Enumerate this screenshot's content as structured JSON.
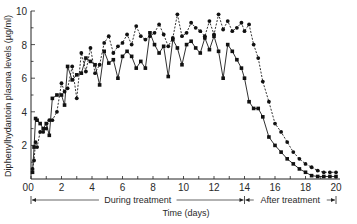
{
  "chart_data": {
    "type": "line",
    "title": "",
    "xlabel": "Time (days)",
    "ylabel": "Diphenylhydantoin plasma levels (µg/ml)",
    "xlim": [
      0,
      20
    ],
    "ylim": [
      0,
      10
    ],
    "x_ticks": [
      "0",
      "2",
      "4",
      "6",
      "8",
      "10",
      "12",
      "14",
      "16",
      "18",
      "20"
    ],
    "y_ticks": [
      "2",
      "4",
      "6",
      "8",
      "10"
    ],
    "y_origin_label": "0",
    "grid": false,
    "legend": null,
    "annotations": [
      {
        "text": "During treatment",
        "from": 0,
        "to": 14
      },
      {
        "text": "After treatment",
        "from": 14,
        "to": 20
      }
    ],
    "series": [
      {
        "name": "solid (squares)",
        "style": "solid",
        "x": [
          0.1,
          0.2,
          0.3,
          0.4,
          0.6,
          0.8,
          1.0,
          1.2,
          1.4,
          1.7,
          2.0,
          2.2,
          2.4,
          2.7,
          3.0,
          3.3,
          3.6,
          3.9,
          4.2,
          4.5,
          4.8,
          5.1,
          5.4,
          5.7,
          6.0,
          6.3,
          6.6,
          6.9,
          7.2,
          7.5,
          7.8,
          8.1,
          8.4,
          8.7,
          9.0,
          9.3,
          9.6,
          9.9,
          10.2,
          10.5,
          10.8,
          11.1,
          11.4,
          11.7,
          12.0,
          12.3,
          12.6,
          12.9,
          13.2,
          13.5,
          13.8,
          14.0,
          14.3,
          14.6,
          14.9,
          15.2,
          15.6,
          16.0,
          16.4,
          16.8,
          17.2,
          17.6,
          18.0,
          18.4,
          18.8,
          19.2,
          19.6,
          20.0
        ],
        "values": [
          0.4,
          1.9,
          3.6,
          3.5,
          3.3,
          3.0,
          3.3,
          2.6,
          4.8,
          5.0,
          5.0,
          4.4,
          6.7,
          5.9,
          6.2,
          6.3,
          7.2,
          7.0,
          6.8,
          5.6,
          7.6,
          6.9,
          7.1,
          6.0,
          7.3,
          7.6,
          7.3,
          6.6,
          7.0,
          6.6,
          8.7,
          8.0,
          7.5,
          7.9,
          6.1,
          8.3,
          7.8,
          6.8,
          8.0,
          8.2,
          7.8,
          7.5,
          8.4,
          7.7,
          8.5,
          7.6,
          6.0,
          8.0,
          7.6,
          7.1,
          6.6,
          6.0,
          4.6,
          4.2,
          4.2,
          3.7,
          2.5,
          2.0,
          1.6,
          1.2,
          0.9,
          0.6,
          0.4,
          0.2,
          0.15,
          0.15,
          0.15,
          0.15
        ]
      },
      {
        "name": "dashed (circles)",
        "style": "dashed",
        "x": [
          0.1,
          0.2,
          0.3,
          0.4,
          0.6,
          0.8,
          1.0,
          1.2,
          1.4,
          1.7,
          2.0,
          2.2,
          2.4,
          2.7,
          3.0,
          3.3,
          3.6,
          3.9,
          4.2,
          4.5,
          4.8,
          5.1,
          5.4,
          5.7,
          6.0,
          6.3,
          6.6,
          6.9,
          7.2,
          7.5,
          7.8,
          8.1,
          8.4,
          8.7,
          9.0,
          9.3,
          9.6,
          9.9,
          10.2,
          10.5,
          10.8,
          11.1,
          11.4,
          11.7,
          12.0,
          12.3,
          12.6,
          12.9,
          13.2,
          13.5,
          13.8,
          14.0,
          14.3,
          14.6,
          14.9,
          15.2,
          15.6,
          16.0,
          16.4,
          16.8,
          17.2,
          17.6,
          18.0,
          18.4,
          18.8,
          19.2,
          19.6,
          20.0
        ],
        "values": [
          0.6,
          1.1,
          2.2,
          1.9,
          2.8,
          2.8,
          3.0,
          3.5,
          3.5,
          4.0,
          5.7,
          5.2,
          5.4,
          6.7,
          4.8,
          7.5,
          6.4,
          7.8,
          6.3,
          6.8,
          8.1,
          8.5,
          7.5,
          7.9,
          8.1,
          8.6,
          8.0,
          9.1,
          8.5,
          8.3,
          8.5,
          8.7,
          9.2,
          8.6,
          7.9,
          8.4,
          9.8,
          8.5,
          8.7,
          9.3,
          9.0,
          8.8,
          8.5,
          9.4,
          8.6,
          9.8,
          8.9,
          9.4,
          8.8,
          9.0,
          9.3,
          8.8,
          9.2,
          8.0,
          7.2,
          5.8,
          4.6,
          3.3,
          2.8,
          2.2,
          1.6,
          1.2,
          0.9,
          0.7,
          0.5,
          0.4,
          0.4,
          0.4
        ]
      }
    ]
  }
}
